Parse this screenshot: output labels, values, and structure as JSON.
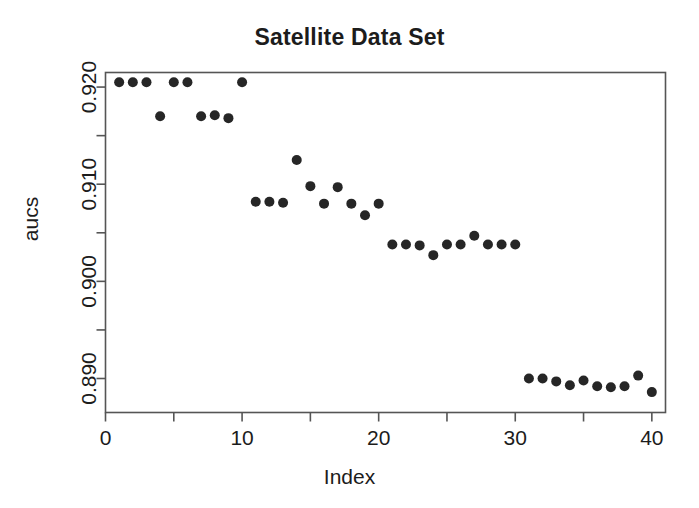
{
  "chart_data": {
    "type": "scatter",
    "title": "Satellite Data Set",
    "xlabel": "Index",
    "ylabel": "aucs",
    "xlim": [
      0,
      41
    ],
    "ylim": [
      0.8865,
      0.9215
    ],
    "grid": false,
    "legend": null,
    "x_ticks": [
      0,
      10,
      20,
      30,
      40
    ],
    "x_tick_labels": [
      "0",
      "10",
      "20",
      "30",
      "40"
    ],
    "x_minor_ticks": [
      5,
      15,
      25,
      35
    ],
    "y_ticks": [
      0.89,
      0.9,
      0.91,
      0.92
    ],
    "y_tick_labels": [
      "0.890",
      "0.900",
      "0.910",
      "0.920"
    ],
    "y_minor_ticks": [
      0.895,
      0.905,
      0.915
    ],
    "point_color": "#262626",
    "point_size": 5,
    "x": [
      1,
      2,
      3,
      4,
      5,
      6,
      7,
      8,
      9,
      10,
      11,
      12,
      13,
      14,
      15,
      16,
      17,
      18,
      19,
      20,
      21,
      22,
      23,
      24,
      25,
      26,
      27,
      28,
      29,
      30,
      31,
      32,
      33,
      34,
      35,
      36,
      37,
      38,
      39,
      40
    ],
    "y": [
      0.9205,
      0.9205,
      0.9205,
      0.917,
      0.9205,
      0.9205,
      0.917,
      0.9171,
      0.9168,
      0.9205,
      0.9082,
      0.9082,
      0.9081,
      0.9125,
      0.9098,
      0.908,
      0.9097,
      0.908,
      0.9068,
      0.908,
      0.9038,
      0.9038,
      0.9037,
      0.9027,
      0.9038,
      0.9038,
      0.9047,
      0.9038,
      0.9038,
      0.9038,
      0.89,
      0.89,
      0.8897,
      0.8893,
      0.8898,
      0.8892,
      0.8891,
      0.8892,
      0.8903,
      0.8886
    ]
  },
  "figure": {
    "background_color": "#ffffff",
    "axis_color": "#555555",
    "text_color": "#1c1c1c"
  }
}
